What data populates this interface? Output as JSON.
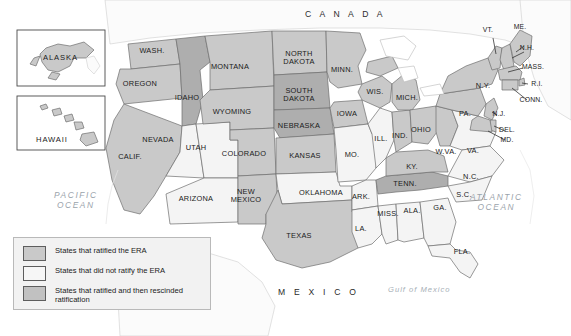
{
  "map": {
    "title_labels": {
      "canada": "C A N A D A",
      "mexico": "M E X I C O",
      "pacific_ocean": "PACIFIC\nOCEAN",
      "pacific_line1": "PACIFIC",
      "pacific_line2": "OCEAN",
      "atlantic_line1": "ATLANTIC",
      "atlantic_line2": "OCEAN",
      "gulf_of_mexico": "Gulf of Mexico"
    },
    "insets": [
      {
        "name": "alaska",
        "label": "ALASKA"
      },
      {
        "name": "hawaii",
        "label": "HAWAII"
      }
    ]
  },
  "legend": {
    "items": [
      {
        "swatch": "ratified",
        "label": "States that ratified the ERA",
        "color": "#c9c9c9"
      },
      {
        "swatch": "not",
        "label": "States that did not ratify the ERA",
        "color": "#f6f6f6"
      },
      {
        "swatch": "rescinded",
        "label": "States that ratified and then rescinded ratification",
        "color": "#c1c1c1"
      }
    ]
  },
  "colors": {
    "ratified": "#c9c9c9",
    "not_ratified": "#f4f4f4",
    "rescinded": "#aeaeae",
    "outside": "#fbfbfb",
    "border": "#6e6e6e",
    "water_text": "#9aa3ab"
  },
  "states": [
    {
      "code": "WASH.",
      "label": "WASH.",
      "status": "ratified",
      "x": 152,
      "y": 51
    },
    {
      "code": "OREGON",
      "label": "OREGON",
      "status": "ratified",
      "x": 140,
      "y": 84
    },
    {
      "code": "CALIF.",
      "label": "CALIF.",
      "status": "ratified",
      "x": 130,
      "y": 157
    },
    {
      "code": "IDAHO",
      "label": "IDAHO",
      "status": "rescinded",
      "x": 187,
      "y": 98
    },
    {
      "code": "NEVADA",
      "label": "NEVADA",
      "status": "not",
      "x": 158,
      "y": 140
    },
    {
      "code": "MONTANA",
      "label": "MONTANA",
      "status": "ratified",
      "x": 230,
      "y": 67
    },
    {
      "code": "WYOMING",
      "label": "WYOMING",
      "status": "ratified",
      "x": 232,
      "y": 112
    },
    {
      "code": "UTAH",
      "label": "UTAH",
      "status": "not",
      "x": 196,
      "y": 148
    },
    {
      "code": "ARIZONA",
      "label": "ARIZONA",
      "status": "not",
      "x": 196,
      "y": 199
    },
    {
      "code": "COLORADO",
      "label": "COLORADO",
      "status": "ratified",
      "x": 244,
      "y": 154
    },
    {
      "code": "NEW MEXICO",
      "label": "NEW\nMEXICO",
      "status": "ratified",
      "x": 246,
      "y": 196
    },
    {
      "code": "NORTH DAKOTA",
      "label": "NORTH\nDAKOTA",
      "status": "ratified",
      "x": 299,
      "y": 58
    },
    {
      "code": "SOUTH DAKOTA",
      "label": "SOUTH\nDAKOTA",
      "status": "rescinded",
      "x": 299,
      "y": 95
    },
    {
      "code": "NEBRASKA",
      "label": "NEBRASKA",
      "status": "rescinded",
      "x": 299,
      "y": 126
    },
    {
      "code": "KANSAS",
      "label": "KANSAS",
      "status": "ratified",
      "x": 305,
      "y": 156
    },
    {
      "code": "OKLAHOMA",
      "label": "OKLAHOMA",
      "status": "not",
      "x": 321,
      "y": 193
    },
    {
      "code": "TEXAS",
      "label": "TEXAS",
      "status": "ratified",
      "x": 299,
      "y": 236
    },
    {
      "code": "MINN.",
      "label": "MINN.",
      "status": "ratified",
      "x": 342,
      "y": 70
    },
    {
      "code": "IOWA",
      "label": "IOWA",
      "status": "ratified",
      "x": 347,
      "y": 114
    },
    {
      "code": "WIS.",
      "label": "WIS.",
      "status": "ratified",
      "x": 375,
      "y": 92
    },
    {
      "code": "MO.",
      "label": "MO.",
      "status": "not",
      "x": 352,
      "y": 155
    },
    {
      "code": "ARK.",
      "label": "ARK.",
      "status": "not",
      "x": 361,
      "y": 197
    },
    {
      "code": "LA.",
      "label": "LA.",
      "status": "not",
      "x": 361,
      "y": 229
    },
    {
      "code": "MISS.",
      "label": "MISS.",
      "status": "not",
      "x": 388,
      "y": 214
    },
    {
      "code": "ALA.",
      "label": "ALA.",
      "status": "not",
      "x": 412,
      "y": 211
    },
    {
      "code": "GA.",
      "label": "GA.",
      "status": "not",
      "x": 440,
      "y": 208
    },
    {
      "code": "FLA.",
      "label": "FLA.",
      "status": "not",
      "x": 462,
      "y": 252
    },
    {
      "code": "ILL.",
      "label": "ILL.",
      "status": "not",
      "x": 381,
      "y": 139
    },
    {
      "code": "IND.",
      "label": "IND.",
      "status": "ratified",
      "x": 400,
      "y": 136
    },
    {
      "code": "OHIO",
      "label": "OHIO",
      "status": "ratified",
      "x": 421,
      "y": 130
    },
    {
      "code": "MICH.",
      "label": "MICH.",
      "status": "ratified",
      "x": 407,
      "y": 98
    },
    {
      "code": "KY.",
      "label": "KY.",
      "status": "ratified",
      "x": 412,
      "y": 167
    },
    {
      "code": "TENN.",
      "label": "TENN.",
      "status": "rescinded",
      "x": 405,
      "y": 184
    },
    {
      "code": "W.VA.",
      "label": "W.VA.",
      "status": "ratified",
      "x": 446,
      "y": 152
    },
    {
      "code": "VA.",
      "label": "VA.",
      "status": "not",
      "x": 473,
      "y": 151
    },
    {
      "code": "N.C.",
      "label": "N.C.",
      "status": "not",
      "x": 471,
      "y": 177
    },
    {
      "code": "S.C.",
      "label": "S.C.",
      "status": "not",
      "x": 464,
      "y": 195
    },
    {
      "code": "PA.",
      "label": "PA.",
      "status": "ratified",
      "x": 465,
      "y": 114
    },
    {
      "code": "N.Y.",
      "label": "N.Y.",
      "status": "ratified",
      "x": 483,
      "y": 86
    }
  ],
  "callout_states": [
    {
      "code": "VT.",
      "label": "VT.",
      "status": "ratified",
      "x": 488,
      "y": 30
    },
    {
      "code": "ME.",
      "label": "ME.",
      "status": "ratified",
      "x": 520,
      "y": 27
    },
    {
      "code": "N.H.",
      "label": "N.H.",
      "status": "ratified",
      "x": 527,
      "y": 48
    },
    {
      "code": "MASS.",
      "label": "MASS.",
      "status": "ratified",
      "x": 533,
      "y": 67
    },
    {
      "code": "R.I.",
      "label": "R.I.",
      "status": "ratified",
      "x": 537,
      "y": 84
    },
    {
      "code": "CONN.",
      "label": "CONN.",
      "status": "ratified",
      "x": 531,
      "y": 100
    },
    {
      "code": "N.J.",
      "label": "N.J.",
      "status": "ratified",
      "x": 499,
      "y": 114
    },
    {
      "code": "DEL.",
      "label": "DEL.",
      "status": "ratified",
      "x": 507,
      "y": 130
    },
    {
      "code": "MD.",
      "label": "MD.",
      "status": "ratified",
      "x": 507,
      "y": 140
    }
  ]
}
